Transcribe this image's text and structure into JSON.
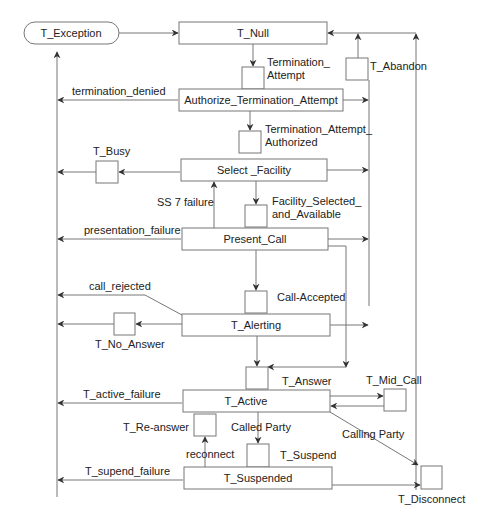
{
  "diagram": {
    "type": "state-transition",
    "colors": {
      "line": "#777777",
      "text": "#222222",
      "background": "#ffffff"
    },
    "exception_state": {
      "label": "T_Exception"
    },
    "states": {
      "null": "T_Null",
      "authorize": "Authorize_Termination_Attempt",
      "select_facility": "Select _Facility",
      "present_call": "Present_Call",
      "alerting": "T_Alerting",
      "active": "T_Active",
      "suspended": "T_Suspended"
    },
    "points_in_call": {
      "termination_attempt": "Termination_\nAttempt",
      "termination_attempt_authorized": "Termination_Attempt_\nAuthorized",
      "facility_selected": "Facility_Selected_\nand_Available",
      "call_accepted": "Call-Accepted",
      "t_answer": "T_Answer",
      "t_suspend": "T_Suspend",
      "t_busy": "T_Busy",
      "t_no_answer": "T_No_Answer",
      "t_re_answer": "T_Re-answer",
      "t_mid_call": "T_Mid_Call",
      "t_disconnect": "T_Disconnect",
      "t_abandon": "T_Abandon"
    },
    "transitions": {
      "termination_denied": "termination_denied",
      "ss7_failure": "SS 7 failure",
      "presentation_failure": "presentation_failure",
      "call_rejected": "call_rejected",
      "t_active_failure": "T_active_failure",
      "called_party": "Called Party",
      "calling_party": "Calling Party",
      "reconnect": "reconnect",
      "t_suspend_failure": "T_supend_failure"
    }
  }
}
